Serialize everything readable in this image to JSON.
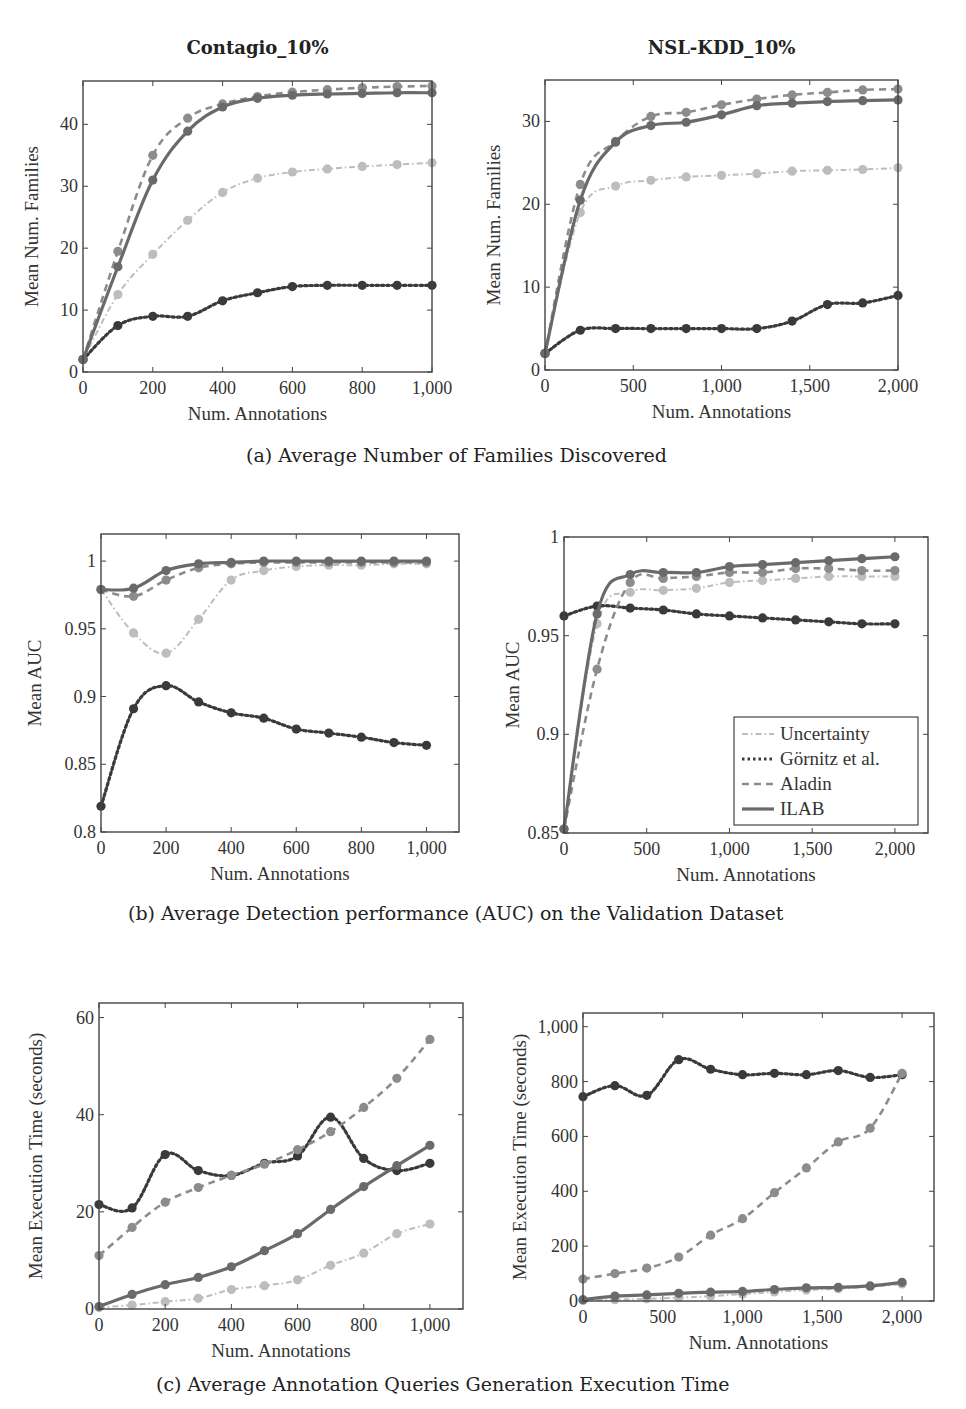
{
  "figure": {
    "captions": {
      "a": "(a) Average Number of Families Discovered",
      "b": "(b) Average Detection performance (AUC) on the Validation Dataset",
      "c": "(c) Average Annotation Queries Generation Execution Time"
    }
  },
  "legend": {
    "entries": [
      {
        "name": "Uncertainty",
        "style": "dash-dot",
        "color": "#bdbdbd"
      },
      {
        "name": "Görnitz et al.",
        "style": "dotted",
        "color": "#3a3a3a"
      },
      {
        "name": "Aladin",
        "style": "dashed",
        "color": "#8c8c8c"
      },
      {
        "name": "ILAB",
        "style": "solid",
        "color": "#6a6a6a"
      }
    ]
  },
  "chart_data": [
    {
      "id": "a-left",
      "type": "line",
      "title": "Contagio_10%",
      "xlabel": "Num. Annotations",
      "ylabel": "Mean Num. Families",
      "xlim": [
        0,
        1000
      ],
      "ylim": [
        0,
        47
      ],
      "xticks": [
        0,
        200,
        400,
        600,
        800,
        1000
      ],
      "xtick_labels": [
        "0",
        "200",
        "400",
        "600",
        "800",
        "1,000"
      ],
      "yticks": [
        0,
        10,
        20,
        30,
        40
      ],
      "ytick_labels": [
        "0",
        "10",
        "20",
        "30",
        "40"
      ],
      "grid": false,
      "legend": false,
      "series": [
        {
          "name": "Uncertainty",
          "x": [
            0,
            100,
            200,
            300,
            400,
            500,
            600,
            700,
            800,
            900,
            1000
          ],
          "y": [
            2,
            12.5,
            19,
            24.5,
            29,
            31.3,
            32.3,
            32.8,
            33.2,
            33.5,
            33.8
          ]
        },
        {
          "name": "Görnitz et al.",
          "x": [
            0,
            100,
            200,
            300,
            400,
            500,
            600,
            700,
            800,
            900,
            1000
          ],
          "y": [
            2,
            7.5,
            9,
            9,
            11.5,
            12.8,
            13.8,
            14,
            14,
            14,
            14
          ]
        },
        {
          "name": "Aladin",
          "x": [
            0,
            100,
            200,
            300,
            400,
            500,
            600,
            700,
            800,
            900,
            1000
          ],
          "y": [
            2,
            19.5,
            35,
            41,
            43.3,
            44.5,
            45.2,
            45.6,
            45.9,
            46.1,
            46.2
          ]
        },
        {
          "name": "ILAB",
          "x": [
            0,
            100,
            200,
            300,
            400,
            500,
            600,
            700,
            800,
            900,
            1000
          ],
          "y": [
            2,
            17,
            31,
            38.9,
            42.8,
            44.2,
            44.7,
            44.9,
            45,
            45.1,
            45.1
          ]
        }
      ]
    },
    {
      "id": "a-right",
      "type": "line",
      "title": "NSL-KDD_10%",
      "xlabel": "Num. Annotations",
      "ylabel": "Mean Num. Families",
      "xlim": [
        0,
        2000
      ],
      "ylim": [
        0,
        35
      ],
      "xticks": [
        0,
        500,
        1000,
        1500,
        2000
      ],
      "xtick_labels": [
        "0",
        "500",
        "1,000",
        "1,500",
        "2,000"
      ],
      "yticks": [
        0,
        10,
        20,
        30
      ],
      "ytick_labels": [
        "0",
        "10",
        "20",
        "30"
      ],
      "grid": false,
      "legend": false,
      "series": [
        {
          "name": "Uncertainty",
          "x": [
            0,
            200,
            400,
            600,
            800,
            1000,
            1200,
            1400,
            1600,
            1800,
            2000
          ],
          "y": [
            2,
            19,
            22.2,
            22.9,
            23.3,
            23.5,
            23.7,
            24,
            24.1,
            24.2,
            24.4
          ]
        },
        {
          "name": "Görnitz et al.",
          "x": [
            0,
            200,
            400,
            600,
            800,
            1000,
            1200,
            1400,
            1600,
            1800,
            2000
          ],
          "y": [
            2,
            4.8,
            5,
            5,
            5,
            5,
            5,
            5.9,
            7.9,
            8.1,
            9
          ]
        },
        {
          "name": "Aladin",
          "x": [
            0,
            200,
            400,
            600,
            800,
            1000,
            1200,
            1400,
            1600,
            1800,
            2000
          ],
          "y": [
            2,
            22.4,
            27.6,
            30.6,
            31.1,
            32,
            32.7,
            33.2,
            33.5,
            33.8,
            33.9
          ]
        },
        {
          "name": "ILAB",
          "x": [
            0,
            200,
            400,
            600,
            800,
            1000,
            1200,
            1400,
            1600,
            1800,
            2000
          ],
          "y": [
            2,
            20.5,
            27.5,
            29.5,
            29.9,
            30.8,
            31.9,
            32.2,
            32.4,
            32.5,
            32.6
          ]
        }
      ]
    },
    {
      "id": "b-left",
      "type": "line",
      "title": "",
      "xlabel": "Num. Annotations",
      "ylabel": "Mean AUC",
      "xlim": [
        0,
        1100
      ],
      "ylim": [
        0.8,
        1.02
      ],
      "xticks": [
        0,
        200,
        400,
        600,
        800,
        1000
      ],
      "xtick_labels": [
        "0",
        "200",
        "400",
        "600",
        "800",
        "1,000"
      ],
      "yticks": [
        0.8,
        0.85,
        0.9,
        0.95,
        1
      ],
      "ytick_labels": [
        "0.8",
        "0.85",
        "0.9",
        "0.95",
        "1"
      ],
      "grid": false,
      "legend": false,
      "series": [
        {
          "name": "Uncertainty",
          "x": [
            0,
            100,
            200,
            300,
            400,
            500,
            600,
            700,
            800,
            900,
            1000
          ],
          "y": [
            0.979,
            0.947,
            0.932,
            0.957,
            0.986,
            0.993,
            0.996,
            0.997,
            0.997,
            0.998,
            0.998
          ]
        },
        {
          "name": "Görnitz et al.",
          "x": [
            0,
            100,
            200,
            300,
            400,
            500,
            600,
            700,
            800,
            900,
            1000
          ],
          "y": [
            0.819,
            0.891,
            0.908,
            0.896,
            0.888,
            0.884,
            0.876,
            0.873,
            0.87,
            0.866,
            0.864
          ]
        },
        {
          "name": "Aladin",
          "x": [
            0,
            100,
            200,
            300,
            400,
            500,
            600,
            700,
            800,
            900,
            1000
          ],
          "y": [
            0.979,
            0.974,
            0.986,
            0.995,
            0.998,
            0.999,
            0.999,
            0.999,
            0.999,
            0.999,
            0.999
          ]
        },
        {
          "name": "ILAB",
          "x": [
            0,
            100,
            200,
            300,
            400,
            500,
            600,
            700,
            800,
            900,
            1000
          ],
          "y": [
            0.979,
            0.98,
            0.993,
            0.998,
            0.999,
            1,
            1,
            1,
            1,
            1,
            1
          ]
        }
      ]
    },
    {
      "id": "b-right",
      "type": "line",
      "title": "",
      "xlabel": "Num. Annotations",
      "ylabel": "Mean AUC",
      "xlim": [
        0,
        2200
      ],
      "ylim": [
        0.85,
        1.0
      ],
      "xticks": [
        0,
        500,
        1000,
        1500,
        2000
      ],
      "xtick_labels": [
        "0",
        "500",
        "1,000",
        "1,500",
        "2,000"
      ],
      "yticks": [
        0.85,
        0.9,
        0.95,
        1
      ],
      "ytick_labels": [
        "0.85",
        "0.9",
        "0.95",
        "1"
      ],
      "grid": false,
      "legend": true,
      "legend_position": "lower right",
      "series": [
        {
          "name": "Uncertainty",
          "x": [
            0,
            200,
            400,
            600,
            800,
            1000,
            1200,
            1400,
            1600,
            1800,
            2000
          ],
          "y": [
            0.852,
            0.956,
            0.972,
            0.973,
            0.974,
            0.977,
            0.978,
            0.979,
            0.98,
            0.98,
            0.98
          ]
        },
        {
          "name": "Görnitz et al.",
          "x": [
            0,
            200,
            400,
            600,
            800,
            1000,
            1200,
            1400,
            1600,
            1800,
            2000
          ],
          "y": [
            0.96,
            0.965,
            0.964,
            0.963,
            0.961,
            0.96,
            0.959,
            0.958,
            0.957,
            0.956,
            0.956
          ]
        },
        {
          "name": "Aladin",
          "x": [
            0,
            200,
            400,
            600,
            800,
            1000,
            1200,
            1400,
            1600,
            1800,
            2000
          ],
          "y": [
            0.852,
            0.933,
            0.977,
            0.979,
            0.98,
            0.982,
            0.982,
            0.984,
            0.984,
            0.983,
            0.983
          ]
        },
        {
          "name": "ILAB",
          "x": [
            0,
            200,
            400,
            600,
            800,
            1000,
            1200,
            1400,
            1600,
            1800,
            2000
          ],
          "y": [
            0.852,
            0.961,
            0.981,
            0.982,
            0.982,
            0.985,
            0.986,
            0.987,
            0.988,
            0.989,
            0.99
          ]
        }
      ]
    },
    {
      "id": "c-left",
      "type": "line",
      "title": "",
      "xlabel": "Num. Annotations",
      "ylabel": "Mean Execution Time (seconds)",
      "xlim": [
        0,
        1100
      ],
      "ylim": [
        0,
        63
      ],
      "xticks": [
        0,
        200,
        400,
        600,
        800,
        1000
      ],
      "xtick_labels": [
        "0",
        "200",
        "400",
        "600",
        "800",
        "1,000"
      ],
      "yticks": [
        0,
        20,
        40,
        60
      ],
      "ytick_labels": [
        "0",
        "20",
        "40",
        "60"
      ],
      "grid": false,
      "legend": false,
      "series": [
        {
          "name": "Uncertainty",
          "x": [
            0,
            100,
            200,
            300,
            400,
            500,
            600,
            700,
            800,
            900,
            1000
          ],
          "y": [
            0.3,
            0.8,
            1.5,
            2.2,
            4,
            4.8,
            6,
            9,
            11.5,
            15.5,
            17.5
          ]
        },
        {
          "name": "Görnitz et al.",
          "x": [
            0,
            100,
            200,
            300,
            400,
            500,
            600,
            700,
            800,
            900,
            1000
          ],
          "y": [
            21.5,
            20.8,
            31.8,
            28.5,
            27.5,
            30,
            31.5,
            39.5,
            31,
            28.5,
            30
          ]
        },
        {
          "name": "Aladin",
          "x": [
            0,
            100,
            200,
            300,
            400,
            500,
            600,
            700,
            800,
            900,
            1000
          ],
          "y": [
            11,
            16.8,
            22,
            25,
            27.5,
            29.8,
            32.8,
            36.5,
            41.5,
            47.5,
            55.5
          ]
        },
        {
          "name": "ILAB",
          "x": [
            0,
            100,
            200,
            300,
            400,
            500,
            600,
            700,
            800,
            900,
            1000
          ],
          "y": [
            0.5,
            3,
            5,
            6.5,
            8.7,
            12,
            15.5,
            20.5,
            25.2,
            29.5,
            33.7
          ]
        }
      ]
    },
    {
      "id": "c-right",
      "type": "line",
      "title": "",
      "xlabel": "Num. Annotations",
      "ylabel": "Mean Execution Time (seconds)",
      "xlim": [
        0,
        2200
      ],
      "ylim": [
        0,
        1050
      ],
      "xticks": [
        0,
        500,
        1000,
        1500,
        2000
      ],
      "xtick_labels": [
        "0",
        "500",
        "1,000",
        "1,500",
        "2,000"
      ],
      "yticks": [
        0,
        200,
        400,
        600,
        800,
        1000
      ],
      "ytick_labels": [
        "0",
        "200",
        "400",
        "600",
        "800",
        "1,000"
      ],
      "grid": false,
      "legend": false,
      "series": [
        {
          "name": "Uncertainty",
          "x": [
            0,
            200,
            400,
            600,
            800,
            1000,
            1200,
            1400,
            1600,
            1800,
            2000
          ],
          "y": [
            2,
            5,
            8,
            12,
            18,
            25,
            33,
            40,
            45,
            52,
            62
          ]
        },
        {
          "name": "Görnitz et al.",
          "x": [
            0,
            200,
            400,
            600,
            800,
            1000,
            1200,
            1400,
            1600,
            1800,
            2000
          ],
          "y": [
            745,
            785,
            750,
            880,
            845,
            825,
            830,
            825,
            840,
            815,
            825
          ]
        },
        {
          "name": "Aladin",
          "x": [
            0,
            200,
            400,
            600,
            800,
            1000,
            1200,
            1400,
            1600,
            1800,
            2000
          ],
          "y": [
            80,
            100,
            120,
            160,
            240,
            300,
            395,
            485,
            580,
            630,
            830
          ]
        },
        {
          "name": "ILAB",
          "x": [
            0,
            200,
            400,
            600,
            800,
            1000,
            1200,
            1400,
            1600,
            1800,
            2000
          ],
          "y": [
            5,
            18,
            22,
            28,
            32,
            35,
            42,
            48,
            50,
            55,
            68
          ]
        }
      ]
    }
  ]
}
